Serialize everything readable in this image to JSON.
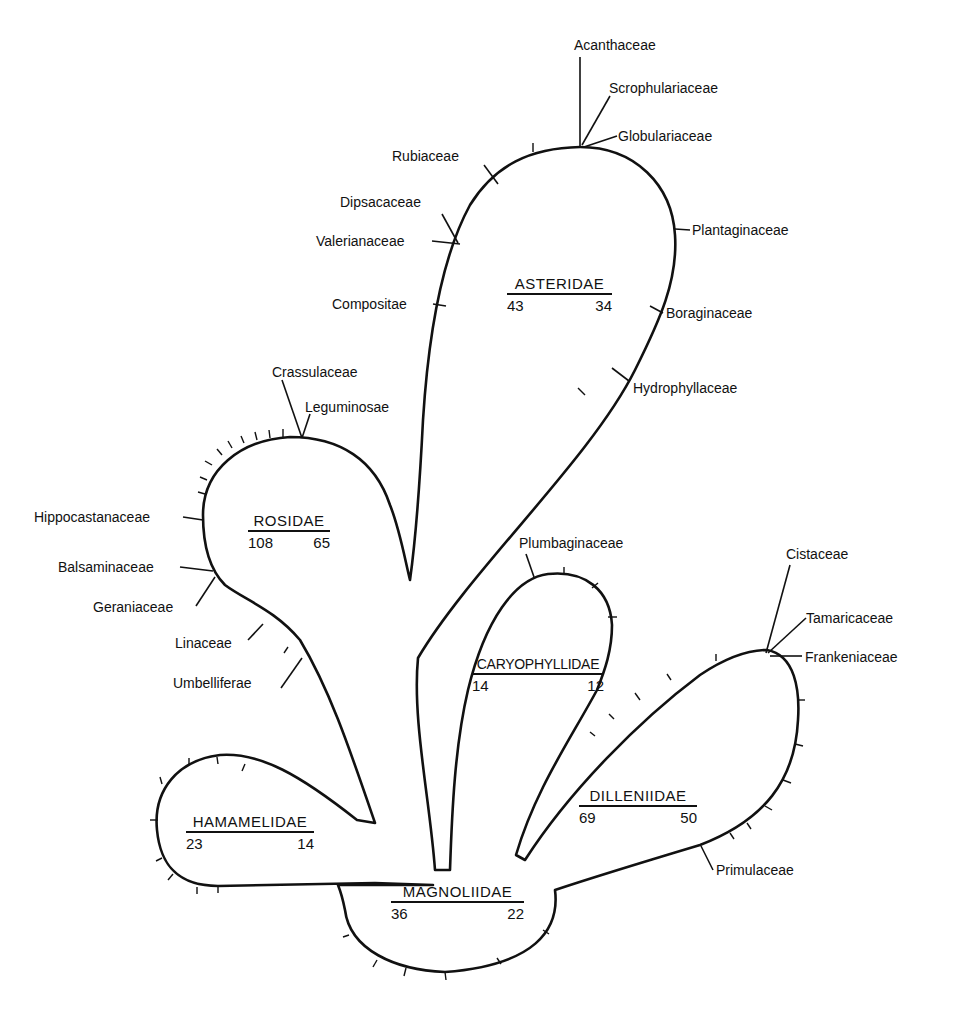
{
  "subclasses": {
    "asteridae": {
      "name": "ASTERIDAE",
      "left": "43",
      "right": "34"
    },
    "rosidae": {
      "name": "ROSIDAE",
      "left": "108",
      "right": "65"
    },
    "caryophyllidae": {
      "name": "CARYOPHYLLIDAE",
      "left": "14",
      "right": "12"
    },
    "dilleniidae": {
      "name": "DILLENIIDAE",
      "left": "69",
      "right": "50"
    },
    "hamamelidae": {
      "name": "HAMAMELIDAE",
      "left": "23",
      "right": "14"
    },
    "magnoliidae": {
      "name": "MAGNOLIIDAE",
      "left": "36",
      "right": "22"
    }
  },
  "families": {
    "acanthaceae": "Acanthaceae",
    "scrophulariaceae": "Scrophulariaceae",
    "globulariaceae": "Globulariaceae",
    "rubiaceae": "Rubiaceae",
    "dipsacaceae": "Dipsacaceae",
    "valerianaceae": "Valerianaceae",
    "compositae": "Compositae",
    "plantaginaceae": "Plantaginaceae",
    "boraginaceae": "Boraginaceae",
    "hydrophyllaceae": "Hydrophyllaceae",
    "crassulaceae": "Crassulaceae",
    "leguminosae": "Leguminosae",
    "hippocastanaceae": "Hippocastanaceae",
    "balsaminaceae": "Balsaminaceae",
    "geraniaceae": "Geraniaceae",
    "linaceae": "Linaceae",
    "umbelliferae": "Umbelliferae",
    "plumbaginaceae": "Plumbaginaceae",
    "cistaceae": "Cistaceae",
    "tamaricaceae": "Tamaricaceae",
    "frankeniaceae": "Frankeniaceae",
    "primulaceae": "Primulaceae"
  },
  "colors": {
    "ink": "#111111",
    "paper": "#ffffff"
  }
}
